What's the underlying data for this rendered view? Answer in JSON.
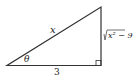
{
  "diagram": {
    "type": "right-triangle",
    "labels": {
      "hypotenuse": "x",
      "angle": "θ",
      "adjacent": "3",
      "opposite_radicand": "x² − 9",
      "opposite_sqrt": "√"
    },
    "colors": {
      "stroke": "#333333",
      "text": "#222222"
    }
  }
}
